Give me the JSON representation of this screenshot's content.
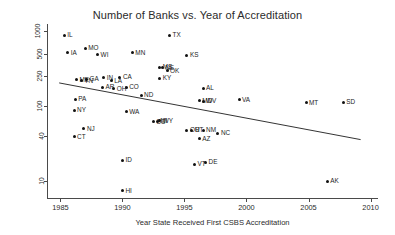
{
  "chart_data": {
    "type": "scatter",
    "title": "Number of Banks vs. Year of Accreditation",
    "xlabel": "Year State Received First CSBS Accreditation",
    "ylabel": "Number of State Banks in 1994",
    "yscale": "log",
    "xlim": [
      1984.0,
      2010.6
    ],
    "ylim": [
      6.0,
      1250.0
    ],
    "xticks": [
      "1985",
      "1990",
      "1995",
      "2000",
      "2005",
      "2010"
    ],
    "xtick_values": [
      1985,
      1990,
      1995,
      2000,
      2005,
      2010
    ],
    "yticks": [
      "1000",
      "500",
      "250",
      "100",
      "40",
      "10"
    ],
    "ytick_values": [
      1000,
      500,
      250,
      100,
      40,
      10
    ],
    "grid": false,
    "legend": null,
    "trendline": {
      "label": "fitted regression line",
      "x_start": 1984.9,
      "y_start": 205,
      "x_end": 2009.2,
      "y_end": 36
    },
    "points": [
      {
        "label": "IL",
        "x": 1985.3,
        "y": 880
      },
      {
        "label": "IA",
        "x": 1985.6,
        "y": 520
      },
      {
        "label": "MO",
        "x": 1987.0,
        "y": 590
      },
      {
        "label": "WI",
        "x": 1988.0,
        "y": 490
      },
      {
        "label": "MN",
        "x": 1990.8,
        "y": 520
      },
      {
        "label": "TX",
        "x": 1993.8,
        "y": 880
      },
      {
        "label": "KS",
        "x": 1995.2,
        "y": 480
      },
      {
        "label": "MS",
        "x": 1993.0,
        "y": 330
      },
      {
        "label": "NE",
        "x": 1993.2,
        "y": 325
      },
      {
        "label": "OK",
        "x": 1993.6,
        "y": 300
      },
      {
        "label": "IN",
        "x": 1988.5,
        "y": 240
      },
      {
        "label": "CA",
        "x": 1989.8,
        "y": 245
      },
      {
        "label": "KY",
        "x": 1993.0,
        "y": 235
      },
      {
        "label": "ME",
        "x": 1986.3,
        "y": 225
      },
      {
        "label": "TN",
        "x": 1986.7,
        "y": 220
      },
      {
        "label": "GA",
        "x": 1987.1,
        "y": 228
      },
      {
        "label": "LA",
        "x": 1989.1,
        "y": 218
      },
      {
        "label": "AR",
        "x": 1988.4,
        "y": 180
      },
      {
        "label": "OH",
        "x": 1989.3,
        "y": 172
      },
      {
        "label": "CO",
        "x": 1990.3,
        "y": 180
      },
      {
        "label": "AL",
        "x": 1996.5,
        "y": 175
      },
      {
        "label": "ND",
        "x": 1991.5,
        "y": 140
      },
      {
        "label": "MD",
        "x": 1996.2,
        "y": 118
      },
      {
        "label": "WV",
        "x": 1996.5,
        "y": 116
      },
      {
        "label": "VA",
        "x": 1999.4,
        "y": 122
      },
      {
        "label": "PA",
        "x": 1986.2,
        "y": 125
      },
      {
        "label": "MT",
        "x": 2004.8,
        "y": 112
      },
      {
        "label": "SD",
        "x": 2007.8,
        "y": 113
      },
      {
        "label": "NY",
        "x": 1986.1,
        "y": 88
      },
      {
        "label": "WA",
        "x": 1990.3,
        "y": 85
      },
      {
        "label": "SC",
        "x": 1992.5,
        "y": 62
      },
      {
        "label": "MI",
        "x": 1992.8,
        "y": 63
      },
      {
        "label": "WY",
        "x": 1993.0,
        "y": 64
      },
      {
        "label": "NJ",
        "x": 1986.9,
        "y": 50
      },
      {
        "label": "OR",
        "x": 1995.2,
        "y": 48
      },
      {
        "label": "UT",
        "x": 1995.6,
        "y": 48
      },
      {
        "label": "NM",
        "x": 1996.5,
        "y": 48
      },
      {
        "label": "NC",
        "x": 1997.7,
        "y": 44
      },
      {
        "label": "CT",
        "x": 1986.1,
        "y": 39
      },
      {
        "label": "AZ",
        "x": 1996.2,
        "y": 37
      },
      {
        "label": "ID",
        "x": 1990.0,
        "y": 19
      },
      {
        "label": "VT",
        "x": 1995.8,
        "y": 17
      },
      {
        "label": "DE",
        "x": 1996.7,
        "y": 18
      },
      {
        "label": "AK",
        "x": 2006.5,
        "y": 10
      },
      {
        "label": "HI",
        "x": 1990.0,
        "y": 7.5
      }
    ]
  }
}
